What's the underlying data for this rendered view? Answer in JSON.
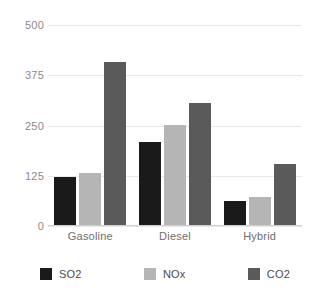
{
  "chart_data": {
    "type": "bar",
    "title": "",
    "subtitle": "",
    "xlabel": "",
    "ylabel": "",
    "categories": [
      "Gasoline",
      "Diesel",
      "Hybrid"
    ],
    "series": [
      {
        "name": "SO2",
        "color": "#1a1a1a",
        "values": [
          123,
          208,
          62
        ]
      },
      {
        "name": "NOx",
        "color": "#b5b5b5",
        "values": [
          132,
          252,
          72
        ]
      },
      {
        "name": "CO2",
        "color": "#5a5a5a",
        "values": [
          408,
          305,
          155
        ]
      }
    ],
    "ylim": [
      0,
      500
    ],
    "yticks": [
      0,
      125,
      250,
      375,
      500
    ],
    "ytick_labels": [
      "0",
      "125",
      "250",
      "375",
      "500"
    ],
    "grid": true,
    "grid_color": "#e8e8e8",
    "legend_position": "bottom",
    "background": "#ffffff"
  }
}
